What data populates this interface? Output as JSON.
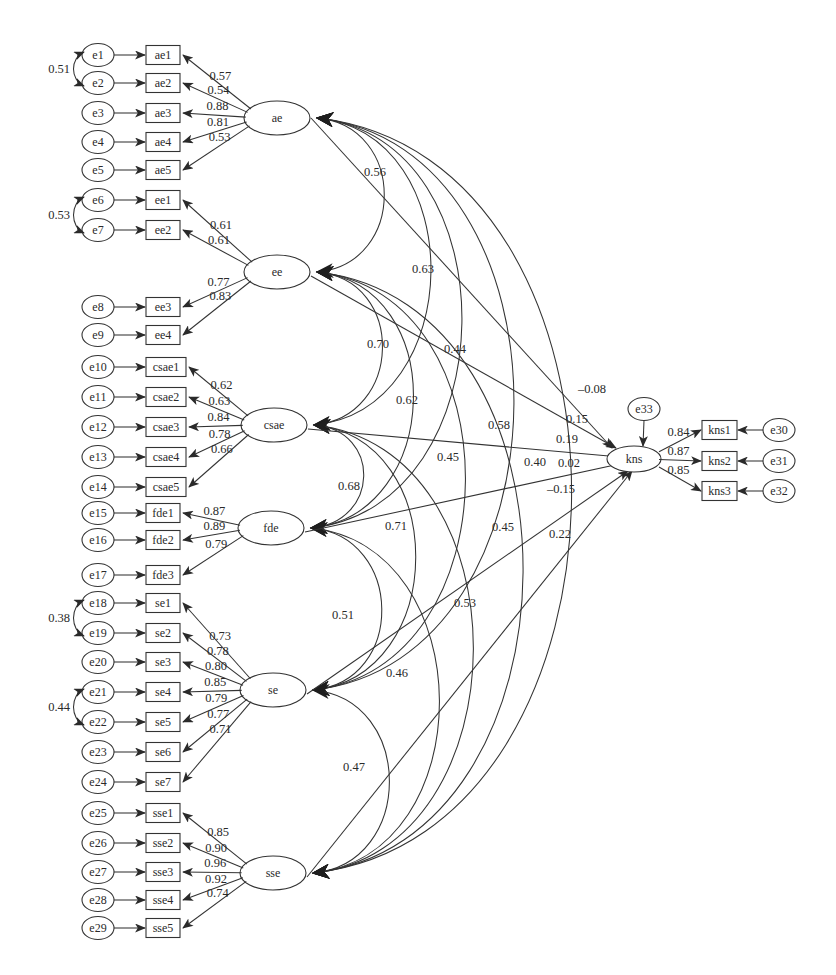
{
  "colors": {
    "line": "#333333",
    "text": "#2a2a2a",
    "background": "#ffffff"
  },
  "latent_factors": [
    {
      "id": "ae",
      "label": "ae",
      "cx": 277,
      "cy": 118
    },
    {
      "id": "ee",
      "label": "ee",
      "cx": 277,
      "cy": 272
    },
    {
      "id": "csae",
      "label": "csae",
      "cx": 274,
      "cy": 425
    },
    {
      "id": "fde",
      "label": "fde",
      "cx": 271,
      "cy": 528
    },
    {
      "id": "se",
      "label": "se",
      "cx": 273,
      "cy": 690
    },
    {
      "id": "sse",
      "label": "sse",
      "cx": 273,
      "cy": 873
    }
  ],
  "indicators": [
    {
      "factor": "ae",
      "label": "ae1",
      "error": "e1",
      "y": 55,
      "loading": "0.57"
    },
    {
      "factor": "ae",
      "label": "ae2",
      "error": "e2",
      "y": 83,
      "loading": "0.54"
    },
    {
      "factor": "ae",
      "label": "ae3",
      "error": "e3",
      "y": 113,
      "loading": "0.88"
    },
    {
      "factor": "ae",
      "label": "ae4",
      "error": "e4",
      "y": 142,
      "loading": "0.81"
    },
    {
      "factor": "ae",
      "label": "ae5",
      "error": "e5",
      "y": 170,
      "loading": "0.53"
    },
    {
      "factor": "ee",
      "label": "ee1",
      "error": "e6",
      "y": 200,
      "loading": "0.61"
    },
    {
      "factor": "ee",
      "label": "ee2",
      "error": "e7",
      "y": 230,
      "loading": "0.61"
    },
    {
      "factor": "ee",
      "label": "ee3",
      "error": "e8",
      "y": 307,
      "loading": "0.77"
    },
    {
      "factor": "ee",
      "label": "ee4",
      "error": "e9",
      "y": 335,
      "loading": "0.83"
    },
    {
      "factor": "csae",
      "label": "csae1",
      "error": "e10",
      "y": 367,
      "loading": "0.62"
    },
    {
      "factor": "csae",
      "label": "csae2",
      "error": "e11",
      "y": 397,
      "loading": "0.63"
    },
    {
      "factor": "csae",
      "label": "csae3",
      "error": "e12",
      "y": 427,
      "loading": "0.84"
    },
    {
      "factor": "csae",
      "label": "csae4",
      "error": "e13",
      "y": 457,
      "loading": "0.78"
    },
    {
      "factor": "csae",
      "label": "csae5",
      "error": "e14",
      "y": 487,
      "loading": "0.66"
    },
    {
      "factor": "fde",
      "label": "fde1",
      "error": "e15",
      "y": 513,
      "loading": "0.87"
    },
    {
      "factor": "fde",
      "label": "fde2",
      "error": "e16",
      "y": 540,
      "loading": "0.89"
    },
    {
      "factor": "fde",
      "label": "fde3",
      "error": "e17",
      "y": 575,
      "loading": "0.79"
    },
    {
      "factor": "se",
      "label": "se1",
      "error": "e18",
      "y": 603,
      "loading": "0.73"
    },
    {
      "factor": "se",
      "label": "se2",
      "error": "e19",
      "y": 633,
      "loading": "0.78"
    },
    {
      "factor": "se",
      "label": "se3",
      "error": "e20",
      "y": 662,
      "loading": "0.80"
    },
    {
      "factor": "se",
      "label": "se4",
      "error": "e21",
      "y": 692,
      "loading": "0.85"
    },
    {
      "factor": "se",
      "label": "se5",
      "error": "e22",
      "y": 722,
      "loading": "0.79"
    },
    {
      "factor": "se",
      "label": "se6",
      "error": "e23",
      "y": 752,
      "loading": "0.77"
    },
    {
      "factor": "se",
      "label": "se7",
      "error": "e24",
      "y": 782,
      "loading": "0.71"
    },
    {
      "factor": "sse",
      "label": "sse1",
      "error": "e25",
      "y": 813,
      "loading": "0.85"
    },
    {
      "factor": "sse",
      "label": "sse2",
      "error": "e26",
      "y": 843,
      "loading": "0.90"
    },
    {
      "factor": "sse",
      "label": "sse3",
      "error": "e27",
      "y": 872,
      "loading": "0.96"
    },
    {
      "factor": "sse",
      "label": "sse4",
      "error": "e28",
      "y": 900,
      "loading": "0.92"
    },
    {
      "factor": "sse",
      "label": "sse5",
      "error": "e29",
      "y": 928,
      "loading": "0.74"
    }
  ],
  "error_covariances": [
    {
      "from": "e1",
      "to": "e2",
      "value": "0.51"
    },
    {
      "from": "e6",
      "to": "e7",
      "value": "0.53"
    },
    {
      "from": "e18",
      "to": "e19",
      "value": "0.38"
    },
    {
      "from": "e21",
      "to": "e22",
      "value": "0.44"
    }
  ],
  "factor_correlations": [
    {
      "a": "ae",
      "b": "ee",
      "value": "0.56",
      "lx": 375,
      "ly": 176
    },
    {
      "a": "ae",
      "b": "csae",
      "value": "0.63",
      "lx": 423,
      "ly": 273
    },
    {
      "a": "ae",
      "b": "fde",
      "value": "0.44",
      "lx": 455,
      "ly": 353
    },
    {
      "a": "ae",
      "b": "se",
      "value": "0.58",
      "lx": 499,
      "ly": 429
    },
    {
      "a": "ae",
      "b": "sse",
      "value": "0.40",
      "lx": 535,
      "ly": 466
    },
    {
      "a": "ee",
      "b": "csae",
      "value": "0.70",
      "lx": 378,
      "ly": 348
    },
    {
      "a": "ee",
      "b": "fde",
      "value": "0.62",
      "lx": 407,
      "ly": 404
    },
    {
      "a": "ee",
      "b": "se",
      "value": "0.45",
      "lx": 448,
      "ly": 461
    },
    {
      "a": "ee",
      "b": "sse",
      "value": "0.45",
      "lx": 503,
      "ly": 531
    },
    {
      "a": "csae",
      "b": "fde",
      "value": "0.68",
      "lx": 349,
      "ly": 490
    },
    {
      "a": "csae",
      "b": "se",
      "value": "0.71",
      "lx": 396,
      "ly": 530
    },
    {
      "a": "csae",
      "b": "sse",
      "value": "0.53",
      "lx": 465,
      "ly": 607
    },
    {
      "a": "fde",
      "b": "se",
      "value": "0.51",
      "lx": 343,
      "ly": 619
    },
    {
      "a": "fde",
      "b": "sse",
      "value": "0.46",
      "lx": 397,
      "ly": 677
    },
    {
      "a": "se",
      "b": "sse",
      "value": "0.47",
      "lx": 354,
      "ly": 771
    }
  ],
  "outcome": {
    "id": "kns",
    "label": "kns",
    "cx": 634,
    "cy": 459,
    "disturbance": {
      "label": "e33",
      "cx": 644,
      "cy": 409
    },
    "indicators": [
      {
        "label": "kns1",
        "error": "e30",
        "y": 430,
        "loading": "0.84"
      },
      {
        "label": "kns2",
        "error": "e31",
        "y": 461,
        "loading": "0.87"
      },
      {
        "label": "kns3",
        "error": "e32",
        "y": 491,
        "loading": "0.85"
      }
    ]
  },
  "structural_paths": [
    {
      "from": "ae",
      "value": "-0.08",
      "lx": 592,
      "ly": 393
    },
    {
      "from": "ee",
      "value": "0.15",
      "lx": 577,
      "ly": 423
    },
    {
      "from": "csae",
      "value": "0.19",
      "lx": 567,
      "ly": 443
    },
    {
      "from": "fde",
      "value": "0.02",
      "lx": 569,
      "ly": 467
    },
    {
      "from": "se",
      "value": "-0.15",
      "lx": 561,
      "ly": 493
    },
    {
      "from": "sse",
      "value": "0.22",
      "lx": 560,
      "ly": 538
    }
  ]
}
